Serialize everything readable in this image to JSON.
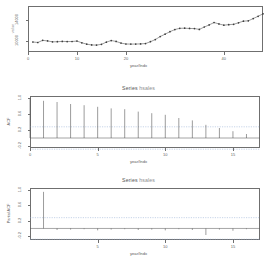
{
  "figure": {
    "kind": "r-statistics-output",
    "background": "#ffffff",
    "foreground": "#4a4a4a",
    "panel_count": 3
  },
  "chart_data": [
    {
      "type": "line",
      "panel": "time-series",
      "title": "",
      "xlabel": "year/Indx",
      "ylabel": "value",
      "xlim": [
        0,
        48
      ],
      "ylim": [
        8000,
        16500
      ],
      "xticks": [
        "0",
        "10",
        "20",
        "40"
      ],
      "xtick_values": [
        0,
        10,
        20,
        40
      ],
      "yticks": [
        "10000",
        "14000"
      ],
      "ytick_values": [
        10000,
        14000
      ],
      "grid": false,
      "marker": "point",
      "x": [
        1,
        2,
        3,
        4,
        5,
        6,
        7,
        8,
        9,
        10,
        11,
        12,
        13,
        14,
        15,
        16,
        17,
        18,
        19,
        20,
        21,
        22,
        23,
        24,
        25,
        26,
        27,
        28,
        29,
        30,
        31,
        32,
        33,
        34,
        35,
        36,
        37,
        38,
        39,
        40,
        41,
        42,
        43,
        44,
        45,
        46,
        47,
        48
      ],
      "values": [
        9850,
        9760,
        10150,
        10050,
        9880,
        9900,
        9960,
        9930,
        9940,
        10020,
        9700,
        9450,
        9300,
        9280,
        9420,
        9820,
        10120,
        9950,
        9640,
        9480,
        9460,
        9470,
        9500,
        9560,
        9900,
        10300,
        10850,
        11300,
        11750,
        12150,
        12380,
        12400,
        12350,
        12330,
        12180,
        12620,
        13000,
        13450,
        13180,
        12960,
        13050,
        13120,
        13400,
        13700,
        13760,
        14180,
        14600,
        15050
      ]
    },
    {
      "type": "bar",
      "panel": "acf",
      "title": "Series",
      "series_name": "hsales",
      "xlabel": "year/Indx",
      "ylabel": "ACF",
      "xlim": [
        0,
        17
      ],
      "ylim": [
        -0.25,
        1.05
      ],
      "xticks": [
        "0",
        "5",
        "10",
        "15"
      ],
      "xtick_values": [
        0,
        5,
        10,
        15
      ],
      "yticks": [
        "-0.2",
        "0.2",
        "0.6",
        "1.0"
      ],
      "ytick_values": [
        -0.2,
        0.2,
        0.6,
        1.0
      ],
      "confidence_band": 0.28,
      "zero_line": 0,
      "lags": [
        0,
        1,
        2,
        3,
        4,
        5,
        6,
        7,
        8,
        9,
        10,
        11,
        12,
        13,
        14,
        15,
        16
      ],
      "values": [
        1.0,
        0.93,
        0.9,
        0.85,
        0.82,
        0.78,
        0.74,
        0.72,
        0.66,
        0.62,
        0.58,
        0.5,
        0.44,
        0.33,
        0.25,
        0.17,
        0.1
      ]
    },
    {
      "type": "bar",
      "panel": "pacf",
      "title": "Series",
      "series_name": "hsales",
      "xlabel": "year/Indx",
      "ylabel": "Partial ACF",
      "xlim": [
        0,
        17
      ],
      "ylim": [
        -0.3,
        1.05
      ],
      "xticks": [
        "5",
        "10",
        "15"
      ],
      "xtick_values": [
        5,
        10,
        15
      ],
      "yticks": [
        "-0.2",
        "0.2",
        "0.6",
        "1.0"
      ],
      "ytick_values": [
        -0.2,
        0.2,
        0.6,
        1.0
      ],
      "confidence_band": 0.28,
      "zero_line": 0,
      "lags": [
        1,
        2,
        3,
        4,
        5,
        6,
        7,
        8,
        9,
        10,
        11,
        12,
        13,
        14,
        15,
        16
      ],
      "values": [
        0.95,
        -0.04,
        -0.03,
        -0.02,
        -0.05,
        -0.03,
        -0.02,
        -0.04,
        -0.03,
        -0.05,
        -0.02,
        -0.04,
        -0.17,
        -0.03,
        -0.06,
        -0.02
      ]
    }
  ],
  "labels": {
    "series_title": "Series",
    "series_name": "hsales",
    "xlab_ts": "year/Indx",
    "xlab_acf": "year/Indx",
    "xlab_pacf": "year/Indx",
    "ylab_ts": "value",
    "ylab_acf": "ACF",
    "ylab_pacf": "Partial ACF"
  }
}
